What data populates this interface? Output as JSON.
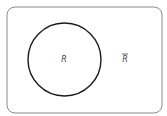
{
  "diagram": {
    "type": "venn",
    "universe": {
      "shape": "rounded-rectangle",
      "x": 7,
      "y": 7,
      "width": 155,
      "height": 106,
      "radius": 8,
      "stroke": "#8a8a8a"
    },
    "sets": [
      {
        "name": "R",
        "label": "R",
        "shape": "circle",
        "cx": 64.5,
        "cy": 59.5,
        "r": 36.5,
        "stroke": "#1a1a1a"
      }
    ],
    "complement": {
      "label": "R",
      "overbar": true,
      "x": 125,
      "y": 59
    },
    "colors": {
      "background": "#ffffff",
      "circle_stroke": "#1a1a1a",
      "rect_stroke": "#8a8a8a",
      "label": "#444444"
    }
  }
}
